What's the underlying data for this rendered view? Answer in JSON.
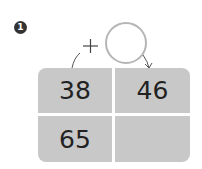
{
  "problem": {
    "number": "1",
    "operator": "+",
    "blank_circle": ""
  },
  "grid": {
    "cells": [
      "38",
      "46",
      "65",
      ""
    ]
  }
}
